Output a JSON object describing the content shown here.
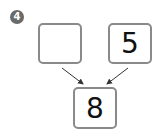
{
  "problem": {
    "number": "4",
    "left_box": "",
    "right_box": "5",
    "result_box": "8"
  },
  "colors": {
    "box_border": "#8a8a8a",
    "badge_bg": "#6a6a6a",
    "arrow": "#333333"
  }
}
